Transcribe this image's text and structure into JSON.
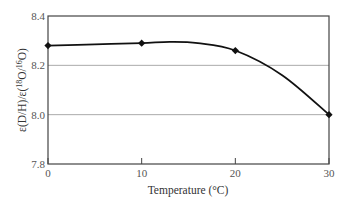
{
  "chart_data": {
    "type": "line",
    "title": "",
    "xlabel": "Temperature (°C)",
    "ylabel": "ε(D/H)/ε(18O/16O)",
    "ylabel_parts": {
      "prefix": "ε(D/H)/ε(",
      "sup1": "18",
      "mid": "O/",
      "sup2": "16",
      "suffix": "O)"
    },
    "x": [
      0,
      10,
      20,
      30
    ],
    "series": [
      {
        "name": "ratio",
        "values": [
          8.28,
          8.29,
          8.26,
          8.0
        ],
        "marker": "diamond",
        "color": "#111111"
      }
    ],
    "curve_hint": {
      "x": [
        0,
        5,
        10,
        13,
        16,
        20,
        25,
        30
      ],
      "y": [
        8.28,
        8.285,
        8.29,
        8.295,
        8.29,
        8.26,
        8.16,
        8.0
      ]
    },
    "xlim": [
      0,
      30
    ],
    "ylim": [
      7.8,
      8.4
    ],
    "x_ticks": [
      "0",
      "10",
      "20",
      "30"
    ],
    "y_ticks": [
      "7.8",
      "8.0",
      "8.2",
      "8.4"
    ],
    "grid": {
      "horizontal": [
        8.0,
        8.2
      ],
      "vertical": false
    },
    "legend": null
  }
}
